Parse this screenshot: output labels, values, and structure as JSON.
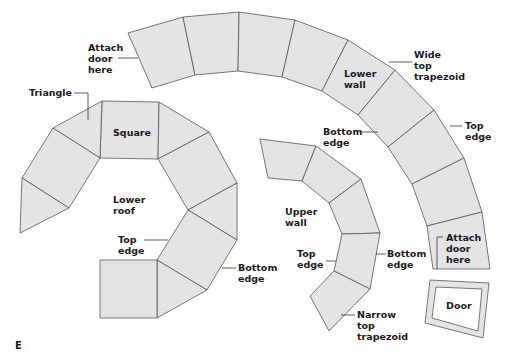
{
  "figure": {
    "letter": "E",
    "colors": {
      "panel_fill": "#e4e4e4",
      "outline": "#555555",
      "text": "#1a1a1a"
    }
  },
  "labels": {
    "attach_door_top": "Attach\ndoor\nhere",
    "triangle": "Triangle",
    "square": "Square",
    "lower_wall": "Lower\nwall",
    "wide_top_trapezoid": "Wide\ntop\ntrapezoid",
    "top_edge_right": "Top\nedge",
    "bottom_edge_upper": "Bottom\nedge",
    "lower_roof": "Lower\nroof",
    "top_edge_roof": "Top\nedge",
    "bottom_edge_roof": "Bottom\nedge",
    "upper_wall": "Upper\nwall",
    "top_edge_upper_wall": "Top\nedge",
    "bottom_edge_upper_wall": "Bottom\nedge",
    "narrow_top_trapezoid": "Narrow\ntop\ntrapezoid",
    "attach_door_bottom": "Attach\ndoor\nhere",
    "door": "Door"
  },
  "shapes": {
    "lower_wall_arc": [
      "128,33 183,17 195,75 152,88",
      "183,17 239,12 238,71 195,75",
      "239,12 295,20 282,77 238,71",
      "295,20 348,40 322,91 282,77",
      "348,40 395,70 358,115 322,91",
      "395,70 434,110 388,147 358,115",
      "434,110 464,158 412,184 388,147",
      "464,158 482,212 427,226 412,184",
      "482,212 490,269 433,269 427,226"
    ],
    "lower_roof": [
      "102,101 159,102 158,159 100,158",
      "53,128 102,101 100,158",
      "53,128 100,158 69,208 22,178",
      "22,178 69,208 20,233",
      "159,102 209,132 158,159",
      "158,159 209,132 237,183 188,210",
      "188,210 237,183 237,240",
      "188,210 237,240 207,290 157,260",
      "157,260 207,290 157,318",
      "100,260 157,260 157,318 100,318"
    ],
    "upper_wall": [
      "260,139 316,146 302,181 268,178",
      "316,146 361,179 329,203 302,181",
      "361,179 380,233 342,234 329,203",
      "342,234 380,233 370,289 334,271",
      "334,271 370,289 329,331 310,296"
    ],
    "door_outer": "430,280 489,283 483,338 425,323",
    "door_inner": "436,287 482,289 478,331 432,318"
  }
}
